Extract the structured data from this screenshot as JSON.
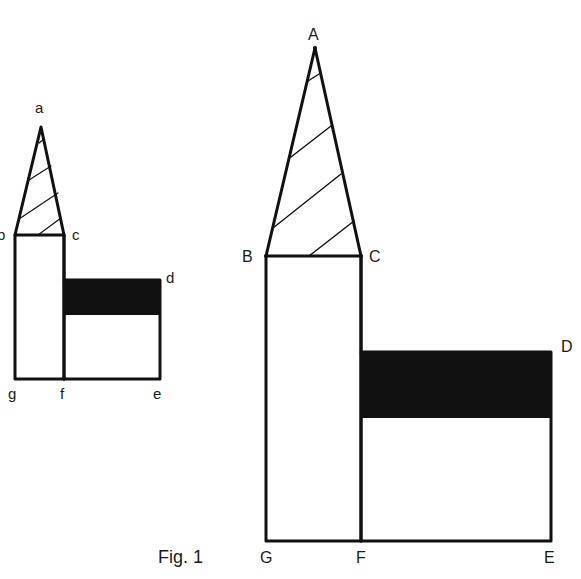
{
  "figure": {
    "caption": "Fig. 1",
    "small_figure": {
      "labels": {
        "a": "a",
        "b": "b",
        "c": "c",
        "d": "d",
        "e": "e",
        "f": "f",
        "g": "g"
      },
      "points": {
        "a": [
          41,
          127
        ],
        "b": [
          15,
          235
        ],
        "c": [
          64,
          235
        ],
        "d": [
          160,
          280
        ],
        "e": [
          160,
          379
        ],
        "f": [
          64,
          379
        ],
        "g": [
          15,
          379
        ]
      },
      "shaded_band": {
        "x1": 64,
        "x2": 160,
        "y1": 280,
        "y2": 315,
        "color": "#111111"
      },
      "hatch_lines": 4
    },
    "large_figure": {
      "labels": {
        "A": "A",
        "B": "B",
        "C": "C",
        "D": "D",
        "E": "E",
        "F": "F",
        "G": "G"
      },
      "points": {
        "A": [
          315,
          48
        ],
        "B": [
          266,
          256
        ],
        "C": [
          361,
          256
        ],
        "D": [
          551,
          352
        ],
        "E": [
          551,
          541
        ],
        "F": [
          361,
          541
        ],
        "G": [
          266,
          541
        ]
      },
      "shaded_band": {
        "x1": 361,
        "x2": 551,
        "y1": 352,
        "y2": 418,
        "color": "#111111"
      },
      "hatch_lines": 4
    },
    "stroke_color": "#111111",
    "background": "#ffffff"
  }
}
